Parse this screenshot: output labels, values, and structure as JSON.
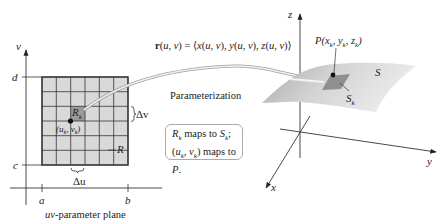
{
  "uv_plane": {
    "caption": "uv-parameter plane",
    "axis_u_ticks": [
      "a",
      "b"
    ],
    "axis_v_ticks": [
      "c",
      "d"
    ],
    "axis_v_label": "v",
    "region_label": "R",
    "subregion_label": "R",
    "subregion_subscript": "k",
    "point_label": "(u",
    "point_label_full": "(u_k, v_k)",
    "delta_u": "Δu",
    "delta_v": "Δv",
    "grid": {
      "cols": 6,
      "rows": 6
    }
  },
  "mapping": {
    "equation": "r(u, v) = ⟨x(u, v), y(u, v), z(u, v)⟩",
    "arrow_label": "Parameterization"
  },
  "note": {
    "line1": "R_k maps to S_k;",
    "line2": "(u_k, v_k) maps to P."
  },
  "surface": {
    "axis_labels": {
      "x": "x",
      "y": "y",
      "z": "z"
    },
    "surface_label": "S",
    "patch_label": "S_k",
    "point_label": "P(x_k, y_k, z_k)"
  },
  "colors": {
    "grid_fill": "#d9d9d9",
    "highlight_cell": "#9a9a9a",
    "surface_light": "#e6e6e6",
    "surface_dark": "#b5b5b5",
    "patch": "#8f8f8f",
    "lines": "#333333"
  }
}
